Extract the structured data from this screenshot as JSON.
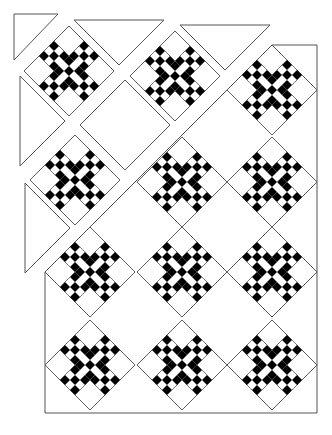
{
  "diagram": {
    "type": "quilt-assembly-diagram",
    "pattern": "double-nine-patch on point",
    "colors": {
      "dark": "#000000",
      "light": "#ffffff",
      "outline": "#555555",
      "background": "#ffffff"
    },
    "block_half_diagonal": 45,
    "block_layout": {
      "grid": 3,
      "nine_patch_positions": [
        [
          0,
          1
        ],
        [
          1,
          0
        ],
        [
          1,
          1
        ],
        [
          1,
          2
        ],
        [
          2,
          1
        ]
      ],
      "plain_positions": [
        [
          0,
          0
        ],
        [
          0,
          2
        ],
        [
          2,
          0
        ],
        [
          2,
          2
        ]
      ],
      "nine_patch_dark_cells": [
        [
          0,
          0
        ],
        [
          0,
          2
        ],
        [
          1,
          1
        ],
        [
          2,
          0
        ],
        [
          2,
          2
        ]
      ]
    },
    "assembled_quilt": {
      "rect": {
        "x": 45,
        "y": 45,
        "width": 272,
        "height": 368
      },
      "diagonal_edge": "x + y = 317",
      "blocks": [
        {
          "cx": 272,
          "cy": 90
        },
        {
          "cx": 182,
          "cy": 182
        },
        {
          "cx": 272,
          "cy": 182
        },
        {
          "cx": 90,
          "cy": 272
        },
        {
          "cx": 182,
          "cy": 272
        },
        {
          "cx": 272,
          "cy": 272
        },
        {
          "cx": 90,
          "cy": 365
        },
        {
          "cx": 182,
          "cy": 365
        },
        {
          "cx": 272,
          "cy": 365
        }
      ]
    },
    "exploded_pieces": {
      "blocks": [
        {
          "cx": 69,
          "cy": 71
        },
        {
          "cx": 175,
          "cy": 76
        },
        {
          "cx": 75,
          "cy": 180
        }
      ],
      "plain_squares": [
        {
          "cx": 125,
          "cy": 125
        }
      ],
      "corner_triangles": [
        {
          "points": [
            [
              14,
              14
            ],
            [
              58,
              14
            ],
            [
              14,
              60
            ]
          ]
        }
      ],
      "setting_triangles": [
        {
          "points": [
            [
              74,
              20
            ],
            [
              164,
              20
            ],
            [
              119,
              65
            ]
          ]
        },
        {
          "points": [
            [
              180,
              25
            ],
            [
              270,
              25
            ],
            [
              225,
              70
            ]
          ]
        },
        {
          "points": [
            [
              20,
              76
            ],
            [
              20,
              166
            ],
            [
              65,
              121
            ]
          ]
        },
        {
          "points": [
            [
              25,
              183
            ],
            [
              25,
              273
            ],
            [
              70,
              228
            ]
          ]
        }
      ]
    }
  }
}
